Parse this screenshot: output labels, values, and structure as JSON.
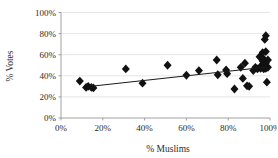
{
  "chart_data": {
    "type": "scatter",
    "title": "",
    "xlabel": "% Muslims",
    "ylabel": "% Votes",
    "xlim": [
      0,
      100
    ],
    "ylim": [
      0,
      100
    ],
    "xticks": [
      "0%",
      "20%",
      "40%",
      "60%",
      "80%",
      "100%"
    ],
    "xtick_values": [
      0,
      20,
      40,
      60,
      80,
      100
    ],
    "yticks": [
      "0%",
      "20%",
      "40%",
      "60%",
      "80%",
      "100%"
    ],
    "ytick_values": [
      0,
      20,
      40,
      60,
      80,
      100
    ],
    "grid": "horizontal",
    "legend": "none",
    "marker": "diamond",
    "marker_color": "#111111",
    "series": [
      {
        "name": "constituencies",
        "points": [
          [
            9,
            35
          ],
          [
            12,
            29
          ],
          [
            13,
            30
          ],
          [
            14.5,
            29
          ],
          [
            15.5,
            28.5
          ],
          [
            31,
            46.5
          ],
          [
            39,
            33
          ],
          [
            51,
            50
          ],
          [
            60,
            40.5
          ],
          [
            66,
            45
          ],
          [
            74.5,
            55
          ],
          [
            75,
            41
          ],
          [
            79,
            45.5
          ],
          [
            79.5,
            42
          ],
          [
            83,
            27.5
          ],
          [
            86,
            48
          ],
          [
            87,
            37.5
          ],
          [
            88,
            52
          ],
          [
            89,
            30.5
          ],
          [
            90,
            30
          ],
          [
            92,
            45
          ],
          [
            93,
            48
          ],
          [
            94,
            46.5
          ],
          [
            95,
            58
          ],
          [
            95.5,
            47
          ],
          [
            96,
            50
          ],
          [
            96.5,
            62
          ],
          [
            96.5,
            54
          ],
          [
            97,
            46.5
          ],
          [
            97,
            56
          ],
          [
            97.5,
            74.5
          ],
          [
            97.5,
            49
          ],
          [
            98,
            78
          ],
          [
            98,
            63
          ],
          [
            98,
            52
          ],
          [
            98,
            47
          ],
          [
            98.5,
            34
          ],
          [
            99,
            55
          ],
          [
            99,
            48
          ]
        ]
      }
    ],
    "trendline": {
      "type": "linear",
      "x_start": 15,
      "y_start": 30.2,
      "x_end": 98,
      "y_end": 48.2
    }
  }
}
